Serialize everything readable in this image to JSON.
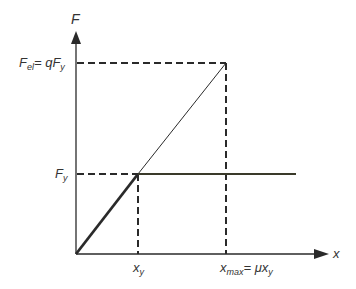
{
  "diagram": {
    "type": "elastic-perfectly-plastic force-displacement idealization",
    "axes": {
      "y_label": "F",
      "x_label": "x"
    },
    "labels": {
      "f_el": {
        "main": "F",
        "sub": "el",
        "eq": "= qF",
        "eq_sub": "y"
      },
      "f_y": {
        "main": "F",
        "sub": "y"
      },
      "x_y": {
        "main": "x",
        "sub": "y"
      },
      "x_max": {
        "main": "x",
        "sub": "max",
        "eq": "= μx",
        "eq_sub": "y"
      }
    },
    "colors": {
      "line": "#2a2a2a",
      "plateau": "#3a3a2a",
      "text": "#333333"
    }
  }
}
